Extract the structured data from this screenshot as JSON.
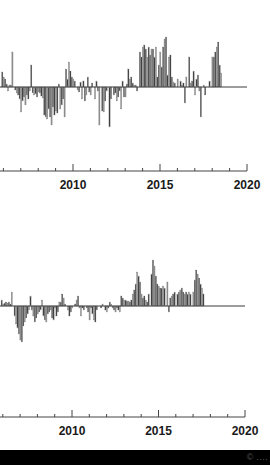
{
  "chart_data": [
    {
      "type": "bar",
      "title": "",
      "xlabel": "",
      "ylabel": "",
      "x_start": 2005.9,
      "x_step": 0.0833,
      "xlim": [
        2005.8,
        2020
      ],
      "xticks_major": [
        2010,
        2015,
        2020
      ],
      "xtick_labels": [
        "2010",
        "2015",
        "2020"
      ],
      "xticks_minor": [
        2006,
        2007,
        2008,
        2009,
        2011,
        2012,
        2013,
        2014,
        2016,
        2017,
        2018,
        2019
      ],
      "grid": false,
      "legend": null,
      "units": "pixels above/below baseline (relative anomaly)",
      "values": [
        15,
        10,
        8,
        3,
        -4,
        2,
        2,
        35,
        0,
        -3,
        -6,
        -8,
        -12,
        -25,
        -14,
        -10,
        -18,
        -8,
        -12,
        -4,
        22,
        -6,
        -8,
        -7,
        -10,
        -5,
        -6,
        -9,
        -11,
        -28,
        -30,
        -32,
        -22,
        -30,
        -38,
        -20,
        -28,
        -24,
        -26,
        3,
        -22,
        -18,
        -12,
        -30,
        18,
        8,
        25,
        16,
        10,
        8,
        6,
        0,
        -3,
        -5,
        5,
        -12,
        6,
        -14,
        -8,
        10,
        -5,
        -8,
        4,
        0,
        -12,
        6,
        -4,
        -38,
        0,
        -24,
        -25,
        -14,
        -4,
        0,
        -40,
        -12,
        0,
        -8,
        -6,
        -14,
        -10,
        -4,
        -22,
        6,
        -10,
        -10,
        3,
        18,
        8,
        10,
        4,
        2,
        2,
        -4,
        0,
        35,
        30,
        40,
        42,
        38,
        30,
        40,
        32,
        38,
        38,
        30,
        40,
        10,
        22,
        35,
        20,
        40,
        48,
        50,
        12,
        30,
        32,
        10,
        5,
        4,
        0,
        8,
        0,
        6,
        2,
        4,
        -16,
        10,
        0,
        30,
        4,
        6,
        16,
        -8,
        8,
        12,
        -4,
        -30,
        0,
        2,
        -8,
        0,
        0,
        6,
        0,
        30,
        30,
        35,
        40,
        45,
        22,
        14
      ],
      "bar_color_dark": "#3a3a3a",
      "bar_color_light": "#8c8c8c",
      "baseline_color": "#3a3a3a",
      "axis_color": "#444444"
    },
    {
      "type": "bar",
      "title": "",
      "xlabel": "",
      "ylabel": "",
      "x_start": 2005.9,
      "x_step": 0.0833,
      "xlim": [
        2005.8,
        2020
      ],
      "xticks_major": [
        2010,
        2015,
        2020
      ],
      "xtick_labels": [
        "2010",
        "2015",
        "2020"
      ],
      "xticks_minor": [
        2006,
        2007,
        2008,
        2009,
        2011,
        2012,
        2013,
        2014,
        2016,
        2017,
        2018,
        2019
      ],
      "grid": false,
      "legend": null,
      "units": "pixels above/below baseline (relative anomaly)",
      "values": [
        6,
        2,
        3,
        4,
        3,
        4,
        2,
        14,
        0,
        -10,
        -18,
        -22,
        -28,
        -34,
        -36,
        -20,
        -16,
        -12,
        -8,
        -4,
        10,
        -4,
        -10,
        -16,
        -12,
        -8,
        -6,
        -4,
        6,
        -10,
        -14,
        -16,
        -8,
        -6,
        -4,
        -12,
        -14,
        -2,
        -10,
        -6,
        4,
        4,
        12,
        8,
        2,
        0,
        -4,
        -10,
        -6,
        -2,
        0,
        2,
        6,
        10,
        -2,
        -10,
        -2,
        -4,
        0,
        -2,
        -6,
        -14,
        -2,
        -8,
        -14,
        -16,
        -4,
        0,
        0,
        -2,
        2,
        0,
        -4,
        -6,
        -2,
        4,
        2,
        -2,
        -4,
        -6,
        -2,
        -4,
        -6,
        10,
        8,
        6,
        6,
        5,
        5,
        4,
        6,
        12,
        16,
        22,
        34,
        30,
        24,
        12,
        8,
        10,
        6,
        4,
        12,
        0,
        32,
        46,
        40,
        30,
        22,
        20,
        18,
        18,
        20,
        18,
        0,
        24,
        -6,
        8,
        10,
        12,
        14,
        0,
        12,
        14,
        16,
        18,
        14,
        12,
        14,
        12,
        14,
        12,
        0,
        14,
        26,
        36,
        32,
        28,
        22,
        18,
        12
      ],
      "bar_color_dark": "#3a3a3a",
      "bar_color_light": "#8c8c8c",
      "baseline_color": "#3a3a3a",
      "axis_color": "#444444"
    }
  ],
  "footer": {
    "text": "© ‥‥"
  }
}
